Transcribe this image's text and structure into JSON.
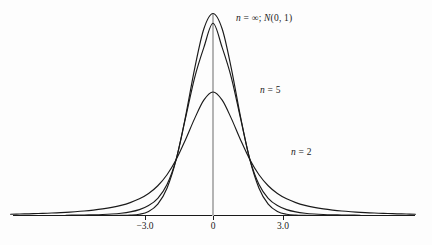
{
  "chart_data": {
    "type": "line",
    "title": "",
    "subtitle": "",
    "xlabel": "",
    "ylabel": "",
    "xlim": [
      -8.8,
      9.6
    ],
    "ylim": [
      0,
      0.42
    ],
    "grid": false,
    "legend_position": "inline-annotations",
    "x_ticks": [
      -3.0,
      0,
      3.0
    ],
    "x_tick_labels": [
      "−3.0",
      "0",
      "3.0"
    ],
    "y_ticks": [],
    "y_tick_labels": [],
    "annotations": [
      {
        "id": "normal",
        "text": "n = ∞; N(0, 1)",
        "x": 1.0,
        "y": 0.385
      },
      {
        "id": "n5",
        "text": "n = 5",
        "x": 2.05,
        "y": 0.262
      },
      {
        "id": "n2",
        "text": "n = 2",
        "x": 3.4,
        "y": 0.155
      }
    ],
    "center_line": {
      "x": 0,
      "from_y": 0,
      "to_y": 0.3989,
      "color": "#b4b4b4"
    },
    "axis_color": "#1a1a1a",
    "curve_color": "#1a1a1a",
    "background": "#fdfdfd",
    "series": [
      {
        "name": "n = 2",
        "label": "n = 2",
        "dof": 2,
        "peak": 0.3536,
        "x": [
          -8.8,
          -8.4,
          -8.0,
          -7.6,
          -7.2,
          -6.8,
          -6.4,
          -6.0,
          -5.6,
          -5.2,
          -4.8,
          -4.4,
          -4.0,
          -3.6,
          -3.2,
          -2.8,
          -2.4,
          -2.0,
          -1.6,
          -1.2,
          -0.8,
          -0.4,
          0.0,
          0.4,
          0.8,
          1.2,
          1.6,
          2.0,
          2.4,
          2.8,
          3.2,
          3.6,
          4.0,
          4.4,
          4.8,
          5.2,
          5.6,
          6.0,
          6.4,
          6.8,
          7.2,
          7.6,
          8.0,
          8.4,
          8.8
        ],
        "y": [
          0.00253,
          0.0029,
          0.00334,
          0.00387,
          0.0045,
          0.00527,
          0.0062,
          0.00736,
          0.0088,
          0.01063,
          0.01297,
          0.01602,
          0.02004,
          0.02547,
          0.03295,
          0.04351,
          0.05879,
          0.08052,
          0.11072,
          0.14921,
          0.19134,
          0.22786,
          0.24398,
          0.22786,
          0.19134,
          0.14921,
          0.11072,
          0.08052,
          0.05879,
          0.04351,
          0.03295,
          0.02547,
          0.02004,
          0.01602,
          0.01297,
          0.01063,
          0.0088,
          0.00736,
          0.0062,
          0.00527,
          0.0045,
          0.00387,
          0.00334,
          0.0029,
          0.00253
        ]
      },
      {
        "name": "n = 5",
        "label": "n = 5",
        "dof": 5,
        "peak": 0.3796,
        "x": [
          -6.4,
          -6.0,
          -5.6,
          -5.2,
          -4.8,
          -4.4,
          -4.0,
          -3.6,
          -3.2,
          -2.8,
          -2.4,
          -2.0,
          -1.6,
          -1.2,
          -0.8,
          -0.4,
          0.0,
          0.4,
          0.8,
          1.2,
          1.6,
          2.0,
          2.4,
          2.8,
          3.2,
          3.6,
          4.0,
          4.4,
          4.8,
          5.2,
          5.6,
          6.0,
          6.4
        ],
        "y": [
          0.0005,
          0.00068,
          0.00095,
          0.00135,
          0.00197,
          0.00295,
          0.00452,
          0.00714,
          0.01164,
          0.01958,
          0.03403,
          0.0611,
          0.11133,
          0.19113,
          0.27196,
          0.33146,
          0.37961,
          0.33146,
          0.27196,
          0.19113,
          0.11133,
          0.0611,
          0.03403,
          0.01958,
          0.01164,
          0.00714,
          0.00452,
          0.00295,
          0.00197,
          0.00135,
          0.00095,
          0.00068,
          0.0005
        ]
      },
      {
        "name": "n = infinity",
        "label": "n = ∞; N(0, 1)",
        "dof": null,
        "peak": 0.3989,
        "x": [
          -4.4,
          -4.0,
          -3.6,
          -3.2,
          -2.8,
          -2.4,
          -2.0,
          -1.6,
          -1.2,
          -0.8,
          -0.4,
          0.0,
          0.4,
          0.8,
          1.2,
          1.6,
          2.0,
          2.4,
          2.8,
          3.2,
          3.6,
          4.0,
          4.4
        ],
        "y": [
          2e-05,
          0.00013,
          0.00061,
          0.00238,
          0.00792,
          0.02239,
          0.05399,
          0.11092,
          0.19419,
          0.28969,
          0.36827,
          0.39894,
          0.36827,
          0.28969,
          0.19419,
          0.11092,
          0.05399,
          0.02239,
          0.00792,
          0.00238,
          0.00061,
          0.00013,
          2e-05
        ]
      }
    ]
  },
  "figure": {
    "tick_neg3": "−3.0",
    "tick_zero": "0",
    "tick_pos3": "3.0",
    "label_normal_var": "n",
    "label_normal_rest": " = ∞; ",
    "label_normal_dist": "N",
    "label_normal_args": "(0, 1)",
    "label_n5_var": "n",
    "label_n5_rest": " = 5",
    "label_n2_var": "n",
    "label_n2_rest": " = 2"
  }
}
